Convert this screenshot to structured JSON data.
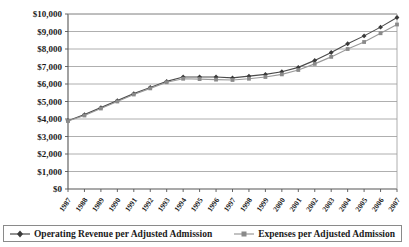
{
  "chart_data": {
    "type": "line",
    "title": "",
    "xlabel": "",
    "ylabel": "",
    "ylim": [
      0,
      10000
    ],
    "ytick_step": 1000,
    "grid": true,
    "legend_position": "bottom",
    "y_tick_labels": [
      "$10,000",
      "$9,000",
      "$8,000",
      "$7,000",
      "$6,000",
      "$5,000",
      "$4,000",
      "$3,000",
      "$2,000",
      "$1,000",
      "$0"
    ],
    "y_tick_values": [
      10000,
      9000,
      8000,
      7000,
      6000,
      5000,
      4000,
      3000,
      2000,
      1000,
      0
    ],
    "categories": [
      "1987",
      "1988",
      "1989",
      "1990",
      "1991",
      "1992",
      "1993",
      "1994",
      "1995",
      "1996",
      "1997",
      "1998",
      "1999",
      "2000",
      "2001",
      "2002",
      "2003",
      "2004",
      "2005",
      "2006",
      "2007"
    ],
    "series": [
      {
        "name": "Operating Revenue per Adjusted Admission",
        "marker": "diamond",
        "color": "#4a4a4a",
        "values": [
          3900,
          4250,
          4650,
          5050,
          5450,
          5800,
          6150,
          6400,
          6400,
          6400,
          6350,
          6450,
          6550,
          6700,
          6950,
          7350,
          7800,
          8300,
          8750,
          9250,
          9800
        ]
      },
      {
        "name": "Expenses per Adjusted Admission",
        "marker": "square",
        "color": "#9a9a9a",
        "values": [
          3880,
          4200,
          4600,
          5000,
          5400,
          5750,
          6100,
          6300,
          6280,
          6250,
          6230,
          6300,
          6400,
          6550,
          6800,
          7150,
          7550,
          8000,
          8400,
          8900,
          9400
        ]
      }
    ]
  },
  "legend": {
    "items": [
      {
        "label": "Operating Revenue per Adjusted Admission",
        "marker": "diamond-marker"
      },
      {
        "label": "Expenses per Adjusted Admission",
        "marker": "square-marker"
      }
    ]
  }
}
